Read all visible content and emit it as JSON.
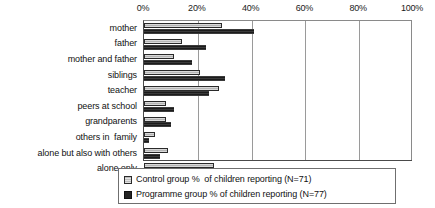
{
  "chart_data": {
    "type": "bar",
    "orientation": "horizontal",
    "title": "",
    "xlabel": "",
    "ylabel": "",
    "xlim": [
      0,
      100
    ],
    "xticks": [
      "0%",
      "20%",
      "40%",
      "60%",
      "80%",
      "100%"
    ],
    "xtick_values": [
      0,
      20,
      40,
      60,
      80,
      100
    ],
    "grid": true,
    "legend_position": "bottom",
    "categories": [
      "mother",
      "father",
      "mother and father",
      "siblings",
      "teacher",
      "peers at school",
      "grandparents",
      "others in  family",
      "alone but also with others",
      "alone only"
    ],
    "series": [
      {
        "name": "Control group % of children reporting (N=71)",
        "short_name": "Control group",
        "color": "#c9c9c9",
        "values": [
          29,
          14,
          11,
          21,
          28,
          8,
          8,
          4,
          9,
          26
        ]
      },
      {
        "name": "Programme group % of children reporting (N=77)",
        "short_name": "Programme group",
        "color": "#2b2b2b",
        "values": [
          41,
          23,
          18,
          30,
          24,
          11,
          10,
          2,
          6,
          12
        ]
      }
    ]
  },
  "legend": {
    "items": [
      {
        "swatch": "control-swatch",
        "label": "Control group %  of children reporting (N=71)"
      },
      {
        "swatch": "programme-swatch",
        "label": "Programme group % of children reporting (N=77)"
      }
    ]
  }
}
